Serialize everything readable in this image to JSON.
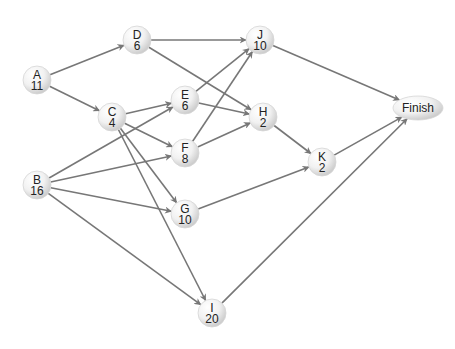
{
  "diagram": {
    "type": "activity-on-node network",
    "colors": {
      "edge": "#777777",
      "node_fill_light": "#ffffff",
      "node_fill_dark": "#cfcfcf",
      "text": "#222222"
    },
    "nodes": [
      {
        "id": "A",
        "label": "A",
        "duration": "11",
        "x": 37,
        "y": 80,
        "shape": "circle"
      },
      {
        "id": "B",
        "label": "B",
        "duration": "16",
        "x": 37,
        "y": 185,
        "shape": "circle"
      },
      {
        "id": "C",
        "label": "C",
        "duration": "4",
        "x": 112,
        "y": 117,
        "shape": "circle"
      },
      {
        "id": "D",
        "label": "D",
        "duration": "6",
        "x": 137,
        "y": 40,
        "shape": "circle"
      },
      {
        "id": "E",
        "label": "E",
        "duration": "6",
        "x": 185,
        "y": 100,
        "shape": "circle"
      },
      {
        "id": "F",
        "label": "F",
        "duration": "8",
        "x": 185,
        "y": 153,
        "shape": "circle"
      },
      {
        "id": "G",
        "label": "G",
        "duration": "10",
        "x": 185,
        "y": 214,
        "shape": "circle"
      },
      {
        "id": "H",
        "label": "H",
        "duration": "2",
        "x": 263,
        "y": 117,
        "shape": "circle"
      },
      {
        "id": "I",
        "label": "I",
        "duration": "20",
        "x": 212,
        "y": 313,
        "shape": "circle"
      },
      {
        "id": "J",
        "label": "J",
        "duration": "10",
        "x": 260,
        "y": 40,
        "shape": "circle"
      },
      {
        "id": "K",
        "label": "K",
        "duration": "2",
        "x": 322,
        "y": 162,
        "shape": "circle"
      },
      {
        "id": "Finish",
        "label": "Finish",
        "duration": "",
        "x": 418,
        "y": 108,
        "shape": "ellipse"
      }
    ],
    "edges": [
      {
        "from": "A",
        "to": "D"
      },
      {
        "from": "A",
        "to": "C"
      },
      {
        "from": "D",
        "to": "J"
      },
      {
        "from": "D",
        "to": "H"
      },
      {
        "from": "C",
        "to": "E"
      },
      {
        "from": "C",
        "to": "F"
      },
      {
        "from": "C",
        "to": "G"
      },
      {
        "from": "C",
        "to": "I"
      },
      {
        "from": "B",
        "to": "E"
      },
      {
        "from": "B",
        "to": "F"
      },
      {
        "from": "B",
        "to": "G"
      },
      {
        "from": "B",
        "to": "I"
      },
      {
        "from": "E",
        "to": "J"
      },
      {
        "from": "E",
        "to": "H"
      },
      {
        "from": "F",
        "to": "J"
      },
      {
        "from": "F",
        "to": "H"
      },
      {
        "from": "G",
        "to": "K"
      },
      {
        "from": "H",
        "to": "K"
      },
      {
        "from": "J",
        "to": "Finish"
      },
      {
        "from": "K",
        "to": "Finish"
      },
      {
        "from": "I",
        "to": "Finish"
      }
    ]
  }
}
